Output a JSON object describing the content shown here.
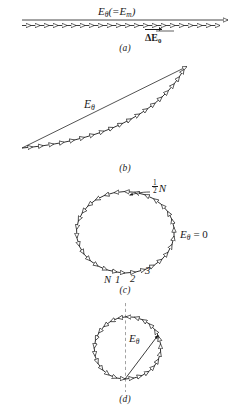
{
  "figure": {
    "ink_color": "#1a1a1a",
    "background": "#ffffff",
    "panels": [
      {
        "id": "a",
        "caption": "(a)",
        "kind": "straight-phasor-chain",
        "arrow_count": 18,
        "labels": {
          "resultant": "E",
          "resultant_sub": "θ",
          "resultant_paren": "(=E",
          "resultant_paren_sub": "m",
          "resultant_paren_close": ")",
          "element": "ΔE",
          "element_sub": "0"
        }
      },
      {
        "id": "b",
        "caption": "(b)",
        "kind": "arc-phasor-chain",
        "arrow_count": 18,
        "labels": {
          "resultant": "E",
          "resultant_sub": "θ"
        }
      },
      {
        "id": "c",
        "caption": "(c)",
        "kind": "closed-circle-phasor",
        "arrow_count": 18,
        "labels": {
          "half_n_num": "1",
          "half_n_den": "2",
          "half_n_var": "N",
          "resultant": "E",
          "resultant_sub": "θ",
          "resultant_value": "= 0",
          "tick_N": "N",
          "tick_1": "1",
          "tick_2": "2",
          "tick_3": "3"
        }
      },
      {
        "id": "d",
        "caption": "(d)",
        "kind": "circle-phasor-with-chord",
        "arrow_count": 17,
        "labels": {
          "resultant": "E",
          "resultant_sub": "θ"
        }
      }
    ]
  }
}
